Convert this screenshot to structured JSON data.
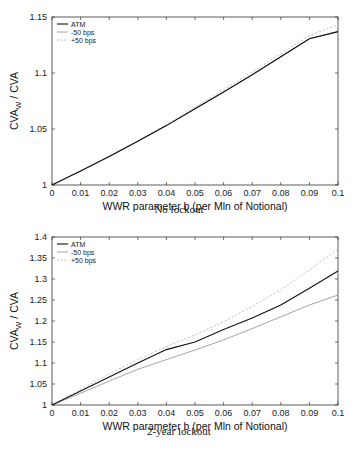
{
  "chart_data": [
    {
      "type": "line",
      "title": "",
      "caption": "No lockout",
      "xlabel": "WWR parameter b (per Mln of Notional)",
      "ylabel": "CVA_W / CVA",
      "xlim": [
        0,
        0.1
      ],
      "ylim": [
        1,
        1.15
      ],
      "xticks": [
        "0",
        "0.01",
        "0.02",
        "0.03",
        "0.04",
        "0.05",
        "0.06",
        "0.07",
        "0.08",
        "0.09",
        "0.1"
      ],
      "yticks": [
        "1",
        "1.05",
        "1.1",
        "1.15"
      ],
      "grid": false,
      "legend_position": "upper left",
      "x": [
        0,
        0.01,
        0.02,
        0.03,
        0.04,
        0.05,
        0.06,
        0.07,
        0.08,
        0.09,
        0.1
      ],
      "series": [
        {
          "name": "ATM",
          "style": "solid",
          "color": "#111111",
          "values": [
            1.0,
            1.0125,
            1.0255,
            1.039,
            1.053,
            1.068,
            1.083,
            1.0985,
            1.1145,
            1.1305,
            1.137
          ]
        },
        {
          "name": "-50 bps",
          "style": "solid",
          "color": "#9a9a9a",
          "values": [
            1.0,
            1.0125,
            1.0255,
            1.039,
            1.053,
            1.068,
            1.083,
            1.0985,
            1.1145,
            1.1305,
            1.137
          ]
        },
        {
          "name": "+50 bps",
          "style": "dashed",
          "color": "#b5b5b5",
          "values": [
            1.0,
            1.0126,
            1.0258,
            1.0395,
            1.054,
            1.0695,
            1.085,
            1.101,
            1.117,
            1.1335,
            1.143
          ]
        }
      ]
    },
    {
      "type": "line",
      "title": "",
      "caption": "2-year lockout",
      "xlabel": "WWR parameter b (per Mln of Notional)",
      "ylabel": "CVA_W / CVA",
      "xlim": [
        0,
        0.1
      ],
      "ylim": [
        1,
        1.4
      ],
      "xticks": [
        "0",
        "0.01",
        "0.02",
        "0.03",
        "0.04",
        "0.05",
        "0.06",
        "0.07",
        "0.08",
        "0.09",
        "0.1"
      ],
      "yticks": [
        "1",
        "1.05",
        "1.1",
        "1.15",
        "1.2",
        "1.25",
        "1.3",
        "1.35",
        "1.4"
      ],
      "grid": false,
      "legend_position": "upper left",
      "x": [
        0,
        0.01,
        0.02,
        0.03,
        0.04,
        0.05,
        0.06,
        0.07,
        0.08,
        0.09,
        0.1
      ],
      "series": [
        {
          "name": "ATM",
          "style": "solid",
          "color": "#111111",
          "values": [
            1.0,
            1.033,
            1.067,
            1.1,
            1.132,
            1.15,
            1.18,
            1.207,
            1.238,
            1.278,
            1.319
          ]
        },
        {
          "name": "-50 bps",
          "style": "solid",
          "color": "#9a9a9a",
          "values": [
            1.0,
            1.028,
            1.057,
            1.085,
            1.108,
            1.131,
            1.155,
            1.182,
            1.21,
            1.238,
            1.262
          ]
        },
        {
          "name": "+50 bps",
          "style": "dashed",
          "color": "#b5b5b5",
          "values": [
            1.0,
            1.037,
            1.074,
            1.108,
            1.139,
            1.167,
            1.198,
            1.235,
            1.274,
            1.322,
            1.371
          ]
        }
      ]
    }
  ],
  "panels": [
    {
      "caption": "No lockout",
      "xlabel": "WWR parameter b (per Mln of Notional)",
      "ylabel_main": "CVA",
      "ylabel_sub": "W",
      "ylabel_rest": " / CVA",
      "legend": [
        "ATM",
        "-50 bps",
        "+50 bps"
      ]
    },
    {
      "caption": "2-year lockout",
      "xlabel": "WWR parameter b (per Mln of Notional)",
      "ylabel_main": "CVA",
      "ylabel_sub": "W",
      "ylabel_rest": " / CVA",
      "legend": [
        "ATM",
        "-50 bps",
        "+50 bps"
      ]
    }
  ]
}
